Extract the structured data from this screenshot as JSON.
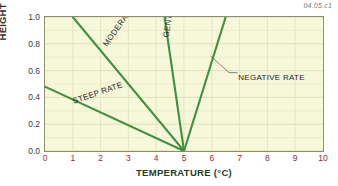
{
  "figure": {
    "corner_id": "04.05.c1",
    "background_color": "#ffffff",
    "plot_background_color": "#f7f7da",
    "line_color": "#3f9142",
    "xtick_color": "#8b2f2a",
    "ytick_color": "#3a3a3a"
  },
  "chart_data": {
    "type": "line",
    "title": "",
    "subtitle": "",
    "xlabel": "TEMPERATURE (°C)",
    "ylabel": "HEIGHT (km)",
    "xlim": [
      0,
      10
    ],
    "ylim": [
      0.0,
      1.0
    ],
    "xticks": [
      "0",
      "1",
      "2",
      "3",
      "4",
      "5",
      "6",
      "7",
      "8",
      "9",
      "10"
    ],
    "yticks": [
      "0.0",
      "0.2",
      "0.4",
      "0.6",
      "0.8",
      "1.0"
    ],
    "grid": true,
    "legend": "none",
    "convergence_point": {
      "x": 5,
      "y": 0.0
    },
    "series": [
      {
        "name": "STEEP RATE",
        "label": "STEEP RATE",
        "color": "#3f9142",
        "x": [
          0,
          5
        ],
        "y": [
          0.48,
          0.0
        ]
      },
      {
        "name": "MODERATE RATE",
        "label": "MODERATE RATE",
        "color": "#3f9142",
        "x": [
          1.0,
          5
        ],
        "y": [
          1.0,
          0.0
        ]
      },
      {
        "name": "GENTLE RATE",
        "label": "GENTLE RATE",
        "color": "#3f9142",
        "x": [
          4.3,
          5
        ],
        "y": [
          1.0,
          0.0
        ]
      },
      {
        "name": "NEGATIVE RATE",
        "label": "NEGATIVE RATE",
        "color": "#3f9142",
        "x": [
          6.5,
          5
        ],
        "y": [
          1.0,
          0.0
        ]
      }
    ],
    "annotations": [
      {
        "text": "STEEP RATE",
        "rotation": -19,
        "x": 1.0,
        "y": 0.4
      },
      {
        "text": "MODERATE RATE",
        "rotation": -55,
        "x": 2.15,
        "y": 0.82
      },
      {
        "text": "GENTLE RATE",
        "rotation": -82,
        "x": 4.35,
        "y": 0.88
      },
      {
        "text": "NEGATIVE RATE",
        "rotation": 0,
        "x": 6.95,
        "y": 0.585
      }
    ]
  }
}
